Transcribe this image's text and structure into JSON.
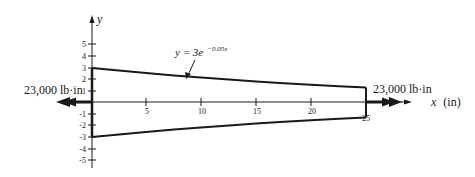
{
  "diagram": {
    "type": "tapered-shaft-torsion",
    "axes": {
      "x_label": "x",
      "x_unit": "(in)",
      "y_label": "y",
      "x_ticks": [
        "5",
        "10",
        "15",
        "20",
        "25"
      ],
      "y_ticks": [
        "5",
        "4",
        "3",
        "2",
        "1",
        "-1",
        "-2",
        "-3",
        "-4",
        "-5"
      ]
    },
    "curve": {
      "equation_prefix": "y = 3e",
      "equation_exponent": "−0.05x",
      "x_range": [
        0,
        25
      ]
    },
    "torques": {
      "left_label": "23,000 lb·in",
      "right_label": "23,000 lb·in"
    },
    "colors": {
      "ink": "#1a1a1a",
      "background": "#ffffff"
    }
  }
}
